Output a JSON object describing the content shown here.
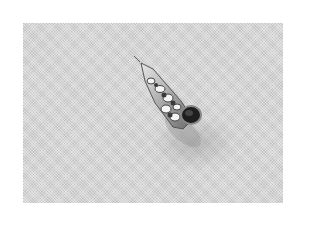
{
  "image": {
    "subject": "spiral seashell",
    "style": "grayscale halftone photograph",
    "background_color": "#d4d4d4",
    "shell_dark": "#2a2a2a",
    "shell_light": "#f2f2f2"
  }
}
